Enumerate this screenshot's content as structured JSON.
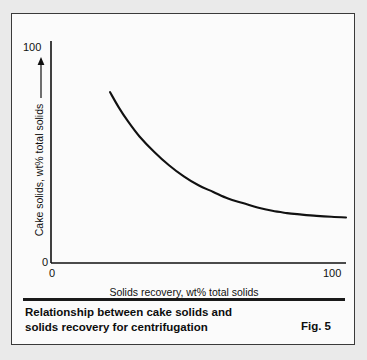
{
  "figure": {
    "caption_line1": "Relationship between cake solids and",
    "caption_line2": "solids recovery for centrifugation",
    "figure_number": "Fig. 5"
  },
  "chart_data": {
    "type": "line",
    "title": "Relationship between cake solids and solids recovery for centrifugation",
    "xlabel": "Solids recovery, wt% total solids",
    "ylabel": "Cake solids, wt% total solids",
    "xlim": [
      0,
      100
    ],
    "ylim": [
      0,
      100
    ],
    "x_ticks": [
      "0",
      "100"
    ],
    "y_ticks": [
      "0",
      "100"
    ],
    "grid": false,
    "legend": null,
    "y_axis_arrow": "up-arrow-icon",
    "line_color": "#111111",
    "series": [
      {
        "name": "Cake solids vs solids recovery",
        "x": [
          20,
          23,
          26,
          30,
          35,
          40,
          45,
          50,
          55,
          60,
          65,
          70,
          75,
          80,
          85,
          90,
          95,
          100
        ],
        "y": [
          77,
          70,
          64,
          57,
          50,
          44,
          39,
          35,
          32,
          29,
          27,
          25,
          23.5,
          22.5,
          21.8,
          21.2,
          20.8,
          20.5
        ]
      }
    ]
  }
}
